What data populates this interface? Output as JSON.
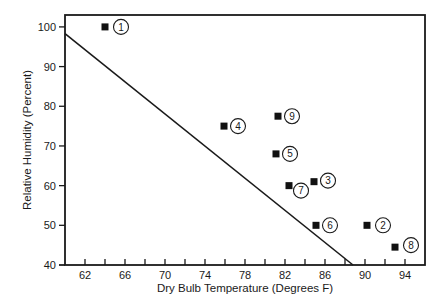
{
  "chart_data": {
    "type": "scatter",
    "title": "",
    "xlabel": "Dry Bulb Temperature (Degrees F)",
    "ylabel": "Relative Humidity (Percent)",
    "xlim": [
      60,
      96
    ],
    "ylim": [
      40,
      103
    ],
    "x_ticks": [
      62,
      64,
      66,
      68,
      70,
      72,
      74,
      76,
      78,
      80,
      82,
      84,
      86,
      88,
      90,
      92,
      94
    ],
    "x_tick_labels": [
      "62",
      "66",
      "70",
      "74",
      "78",
      "82",
      "86",
      "90",
      "94"
    ],
    "x_tick_label_values": [
      62,
      66,
      70,
      74,
      78,
      82,
      86,
      90,
      94
    ],
    "y_ticks": [
      40,
      50,
      60,
      70,
      80,
      90,
      100
    ],
    "y_tick_labels": [
      "40",
      "50",
      "60",
      "70",
      "80",
      "90",
      "100"
    ],
    "grid": false,
    "legend": null,
    "series": [
      {
        "name": "Observations",
        "marker": "square",
        "points": [
          {
            "label": "1",
            "x": 64,
            "y": 100
          },
          {
            "label": "2",
            "x": 90.2,
            "y": 50
          },
          {
            "label": "3",
            "x": 84.9,
            "y": 61
          },
          {
            "label": "4",
            "x": 75.9,
            "y": 75
          },
          {
            "label": "5",
            "x": 81.1,
            "y": 68
          },
          {
            "label": "6",
            "x": 85.1,
            "y": 50
          },
          {
            "label": "7",
            "x": 82.4,
            "y": 60
          },
          {
            "label": "8",
            "x": 93,
            "y": 44.5
          },
          {
            "label": "9",
            "x": 81.3,
            "y": 77.5
          }
        ]
      }
    ],
    "reference_line": {
      "name": "Boundary line",
      "x": [
        60,
        88.8
      ],
      "y": [
        98.3,
        40
      ]
    },
    "label_offsets": {
      "1": [
        16,
        0
      ],
      "2": [
        16,
        0
      ],
      "3": [
        14,
        -1
      ],
      "4": [
        14,
        0
      ],
      "5": [
        14,
        0
      ],
      "6": [
        14,
        0
      ],
      "7": [
        12,
        5
      ],
      "8": [
        16,
        -2
      ],
      "9": [
        14,
        0
      ]
    }
  }
}
